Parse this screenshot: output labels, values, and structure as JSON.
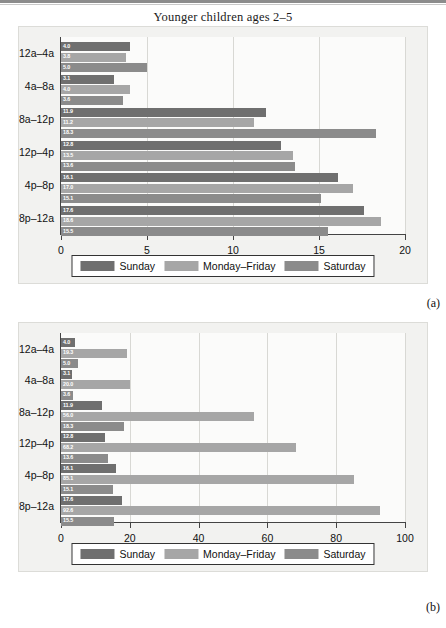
{
  "figure": {
    "panels": [
      {
        "tag": "(a)"
      },
      {
        "tag": "(b)"
      }
    ]
  },
  "panel_a": {
    "title": "Younger children ages 2–5",
    "xlabel": "Exposure (ads per younger child)",
    "legend": [
      "Sunday",
      "Monday–Friday",
      "Saturday"
    ],
    "xticks": [
      "0",
      "5",
      "10",
      "15",
      "20"
    ]
  },
  "panel_b": {
    "title": "",
    "xlabel": "Exposure (ads per younger child)",
    "legend": [
      "Sunday",
      "Monday–Friday",
      "Saturday"
    ],
    "xticks": [
      "0",
      "20",
      "40",
      "60",
      "80",
      "100"
    ]
  },
  "colors": {
    "sunday": "#6f6f6f",
    "monday_friday": "#a6a6a6",
    "saturday": "#8b8b8b",
    "axis": "#444444",
    "grid": "#d8d8d4",
    "panel_bg": "#f2f2f0",
    "plot_bg": "#fbfbfa",
    "text": "#111111"
  },
  "chart_data": [
    {
      "type": "bar",
      "orientation": "horizontal",
      "title": "Younger children ages 2–5",
      "xlabel": "Exposure (ads per younger child)",
      "ylabel": "",
      "xlim": [
        0,
        20
      ],
      "xticks": [
        0,
        5,
        10,
        15,
        20
      ],
      "grid": true,
      "legend_position": "below",
      "categories": [
        "12a–4a",
        "4a–8a",
        "8a–12p",
        "12p–4p",
        "4p–8p",
        "8p–12a"
      ],
      "series": [
        {
          "name": "Sunday",
          "color": "#6f6f6f",
          "values": [
            4.0,
            3.1,
            11.9,
            12.8,
            16.1,
            17.6
          ]
        },
        {
          "name": "Monday–Friday",
          "color": "#a6a6a6",
          "values": [
            3.8,
            4.0,
            11.2,
            13.5,
            17.0,
            18.6
          ]
        },
        {
          "name": "Saturday",
          "color": "#8b8b8b",
          "values": [
            5.0,
            3.6,
            18.3,
            13.6,
            15.1,
            15.5
          ]
        }
      ]
    },
    {
      "type": "bar",
      "orientation": "horizontal",
      "title": "",
      "xlabel": "Exposure (ads per younger child)",
      "ylabel": "",
      "xlim": [
        0,
        100
      ],
      "xticks": [
        0,
        20,
        40,
        60,
        80,
        100
      ],
      "grid": true,
      "legend_position": "below",
      "categories": [
        "12a–4a",
        "4a–8a",
        "8a–12p",
        "12p–4p",
        "4p–8p",
        "8p–12a"
      ],
      "series": [
        {
          "name": "Sunday",
          "color": "#6f6f6f",
          "values": [
            4.0,
            3.1,
            11.9,
            12.8,
            16.1,
            17.6
          ]
        },
        {
          "name": "Monday–Friday",
          "color": "#a6a6a6",
          "values": [
            19.3,
            20.0,
            56.0,
            68.2,
            85.1,
            92.6
          ]
        },
        {
          "name": "Saturday",
          "color": "#8b8b8b",
          "values": [
            5.0,
            3.6,
            18.3,
            13.6,
            15.1,
            15.5
          ]
        }
      ]
    }
  ]
}
